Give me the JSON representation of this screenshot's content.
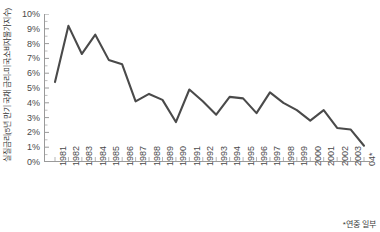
{
  "chart_data": {
    "type": "line",
    "title": "",
    "ylabel": "실질금리(5년 만기 국채 금리-미국소비자물가지수)",
    "xlabel": "",
    "ylim": [
      0,
      10
    ],
    "ytick_labels": [
      "0%",
      "1%",
      "2%",
      "3%",
      "4%",
      "5%",
      "6%",
      "7%",
      "8%",
      "9%",
      "10%"
    ],
    "ytick_values": [
      0,
      1,
      2,
      3,
      4,
      5,
      6,
      7,
      8,
      9,
      10
    ],
    "grid": false,
    "legend": "none",
    "line_color": "#4a4a4a",
    "axis_color": "#9a9a9a",
    "categories": [
      "1981",
      "1982",
      "1983",
      "1984",
      "1985",
      "1986",
      "1987",
      "1988",
      "1989",
      "1990",
      "1991",
      "1992",
      "1993",
      "1994",
      "1995",
      "1996",
      "1997",
      "1998",
      "1999",
      "2000",
      "2001",
      "2002",
      "2003",
      "04*"
    ],
    "values": [
      5.4,
      9.2,
      7.3,
      8.6,
      6.9,
      6.6,
      4.1,
      4.6,
      4.2,
      2.7,
      4.9,
      4.1,
      3.2,
      4.4,
      4.3,
      3.3,
      4.7,
      4.0,
      3.5,
      2.8,
      3.5,
      2.3,
      2.2,
      1.1
    ],
    "footnote": "*연중 일부"
  }
}
